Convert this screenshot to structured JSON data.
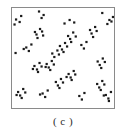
{
  "figure": {
    "caption": "( c )",
    "panel_label": "c",
    "point_color": "#1a1a1a",
    "frame_color": "#8a8a8a",
    "background_color": "#ffffff"
  },
  "chart_data": {
    "type": "scatter",
    "title": "",
    "subtitle": "",
    "xlabel": "",
    "ylabel": "",
    "xlim": [
      0,
      100
    ],
    "ylim": [
      0,
      100
    ],
    "grid": false,
    "legend": null,
    "annotations": [
      "( c )"
    ],
    "marker": "square",
    "marker_size_px": 2.2,
    "marker_color": "#1a1a1a",
    "n_points": 98,
    "n_clusters": 22,
    "series": [
      {
        "name": "points",
        "x": [
          4.0,
          9.0,
          2.5,
          7.5,
          26.5,
          31.0,
          29.0,
          51.5,
          56.5,
          61.0,
          88.5,
          22.5,
          27.5,
          24.0,
          29.5,
          25.0,
          30.5,
          55.0,
          60.0,
          57.0,
          62.5,
          58.0,
          76.5,
          81.5,
          78.0,
          83.0,
          79.5,
          95.5,
          99.0,
          93.5,
          97.5,
          47.0,
          52.0,
          49.0,
          54.0,
          50.5,
          68.0,
          73.0,
          70.5,
          14.0,
          19.0,
          16.5,
          11.5,
          3.5,
          39.5,
          44.5,
          41.5,
          46.0,
          34.0,
          39.0,
          36.0,
          41.0,
          37.5,
          33.0,
          84.0,
          89.0,
          86.0,
          91.0,
          87.5,
          22.0,
          27.0,
          24.5,
          29.0,
          25.5,
          20.5,
          55.5,
          60.5,
          57.5,
          62.0,
          58.5,
          53.5,
          43.0,
          48.0,
          45.0,
          50.0,
          46.5,
          83.5,
          88.5,
          85.5,
          90.5,
          87.0,
          6.0,
          11.0,
          8.0,
          13.0,
          9.5,
          4.5,
          30.0,
          35.0,
          32.5,
          27.5,
          66.0,
          71.0,
          68.5,
          92.0,
          97.0,
          94.5,
          90.0,
          95.0
        ],
        "y": [
          88.5,
          92.0,
          83.5,
          86.0,
          96.5,
          93.0,
          90.0,
          84.5,
          88.0,
          85.5,
          95.0,
          76.0,
          79.0,
          73.5,
          76.5,
          70.0,
          72.5,
          72.0,
          75.5,
          69.0,
          71.5,
          66.0,
          78.0,
          81.0,
          74.5,
          77.0,
          71.0,
          88.0,
          91.0,
          84.0,
          86.5,
          62.0,
          65.0,
          58.5,
          61.5,
          56.0,
          63.0,
          66.0,
          59.5,
          60.5,
          63.5,
          57.0,
          59.0,
          55.0,
          54.5,
          57.5,
          51.0,
          53.5,
          44.0,
          47.0,
          40.5,
          43.5,
          38.0,
          41.0,
          46.5,
          49.5,
          43.0,
          46.0,
          40.0,
          42.0,
          45.0,
          38.5,
          41.5,
          36.0,
          39.0,
          34.0,
          37.0,
          30.5,
          33.5,
          28.0,
          31.0,
          26.0,
          29.0,
          22.5,
          25.5,
          20.0,
          24.0,
          27.0,
          20.5,
          23.5,
          18.0,
          16.0,
          19.0,
          12.5,
          15.5,
          10.0,
          13.0,
          14.5,
          17.5,
          11.0,
          13.5,
          12.0,
          15.0,
          8.5,
          13.0,
          16.0,
          9.5,
          12.5,
          7.0
        ]
      }
    ]
  }
}
